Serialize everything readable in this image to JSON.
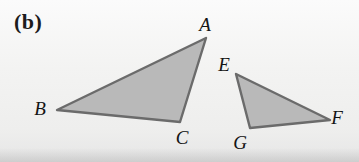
{
  "figure": {
    "panel_label": "(b)",
    "background_color": "#f4f4f3",
    "fill_color": "#b9b9b9",
    "stroke_color": "#6b6b6b",
    "label_color": "#141414",
    "width": 359,
    "height": 162
  },
  "triangles": [
    {
      "name": "triangle-abc",
      "vertices": [
        {
          "label": "A",
          "x": 206,
          "y": 38,
          "label_x": 205,
          "label_y": 24
        },
        {
          "label": "B",
          "x": 57,
          "y": 110,
          "label_x": 40,
          "label_y": 108
        },
        {
          "label": "C",
          "x": 180,
          "y": 122,
          "label_x": 182,
          "label_y": 137
        }
      ],
      "points": "206,38 57,110 180,122"
    },
    {
      "name": "triangle-efg",
      "vertices": [
        {
          "label": "E",
          "x": 236,
          "y": 74,
          "label_x": 224,
          "label_y": 64
        },
        {
          "label": "F",
          "x": 330,
          "y": 120,
          "label_x": 337,
          "label_y": 117
        },
        {
          "label": "G",
          "x": 250,
          "y": 128,
          "label_x": 240,
          "label_y": 142
        }
      ],
      "points": "236,74 330,120 250,128"
    }
  ]
}
